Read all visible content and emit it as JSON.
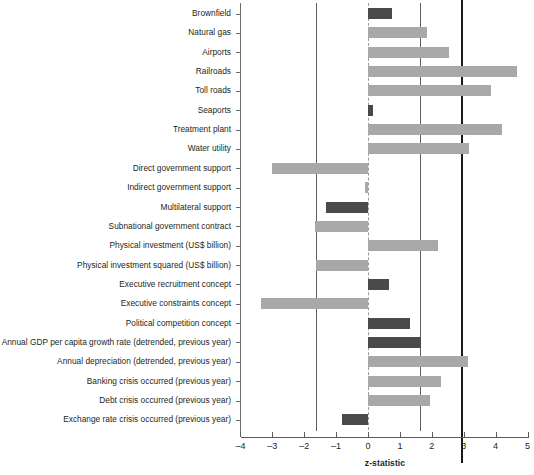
{
  "chart_data": {
    "type": "bar",
    "orientation": "horizontal",
    "title": "",
    "xlabel": "z-statistic",
    "ylabel": "",
    "xlim": [
      -4,
      5
    ],
    "xticks": [
      -4,
      -3,
      -2,
      -1,
      0,
      1,
      2,
      3,
      4,
      5
    ],
    "xtick_labels": [
      "–4",
      "–3",
      "–2",
      "–1",
      "0",
      "1",
      "2",
      "3",
      "4",
      "5"
    ],
    "grid": false,
    "legend": null,
    "reference_lines": [
      {
        "value": -1.645,
        "style": "thin",
        "color": "#5e5e5e"
      },
      {
        "value": 0,
        "style": "dashed",
        "color": "#9a9a9a"
      },
      {
        "value": 1.645,
        "style": "thin",
        "color": "#5e5e5e"
      },
      {
        "value": 2.94,
        "style": "thick",
        "color": "#1a1a1a"
      }
    ],
    "colors": {
      "light": "#a8a8a8",
      "dark": "#4a4a4a"
    },
    "categories": [
      "Brownfield",
      "Natural gas",
      "Airports",
      "Railroads",
      "Toll roads",
      "Seaports",
      "Treatment plant",
      "Water utility",
      "Direct government support",
      "Indirect government support",
      "Multilateral support",
      "Subnational government contract",
      "Physical investment (US$ billion)",
      "Physical investment squared (US$ billion)",
      "Executive recruitment concept",
      "Executive constraints concept",
      "Political competition concept",
      "Annual GDP per capita growth rate (detrended, previous year)",
      "Annual depreciation (detrended, previous year)",
      "Banking crisis occurred (previous year)",
      "Debt crisis occurred (previous year)",
      "Exchange rate crisis occurred (previous year)"
    ],
    "values": [
      0.75,
      1.84,
      2.55,
      4.66,
      3.87,
      0.15,
      4.2,
      3.18,
      -3.0,
      -0.08,
      -1.31,
      -1.65,
      2.21,
      -1.64,
      0.67,
      -3.35,
      1.32,
      1.65,
      3.12,
      2.3,
      1.95,
      -0.82
    ],
    "bar_colors": [
      "dark",
      "light",
      "light",
      "light",
      "light",
      "dark",
      "light",
      "light",
      "light",
      "light",
      "dark",
      "light",
      "light",
      "light",
      "dark",
      "light",
      "dark",
      "dark",
      "light",
      "light",
      "light",
      "dark"
    ]
  }
}
